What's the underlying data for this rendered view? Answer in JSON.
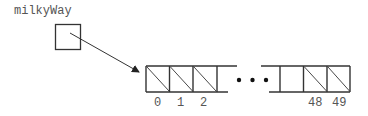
{
  "diagram": {
    "variable": {
      "name": "milkyWay"
    },
    "array": {
      "length": 50,
      "left_indices": [
        "0",
        "1",
        "2"
      ],
      "right_indices": [
        "48",
        "49"
      ],
      "ellipsis": "• • •"
    },
    "colors": {
      "stroke": "#333333",
      "label": "#555555",
      "background": "#ffffff"
    }
  }
}
